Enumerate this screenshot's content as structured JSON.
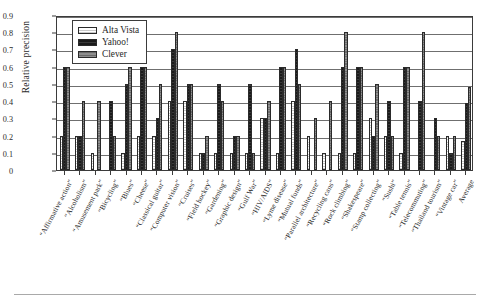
{
  "chart_data": {
    "type": "bar",
    "title": "",
    "xlabel": "",
    "ylabel": "Relative precision",
    "ylim": [
      0,
      0.9
    ],
    "ytick_labels": [
      "0",
      "0.1",
      "0.2",
      "0.3",
      "0.4",
      "0.5",
      "0.6",
      "0.7",
      "0.8",
      "0.9"
    ],
    "ytick_values": [
      0,
      0.1,
      0.2,
      0.3,
      0.4,
      0.5,
      0.6,
      0.7,
      0.8,
      0.9
    ],
    "grid": true,
    "legend_position": "upper-left-inside",
    "categories": [
      "“Affirmative action”",
      "“Alcoholism”",
      "“Amusement park”",
      "“Bicycling”",
      "“Blues”",
      "“Cheese”",
      "“Classical guitar”",
      "“Computer vision”",
      "“Cruises”",
      "“Field hockey”",
      "“Gardening”",
      "“Graphic design”",
      "“Gulf War”",
      "“HIV/AIDS”",
      "“Lyme disease”",
      "“Mutual funds”",
      "“Parallel architecture”",
      "“Recycling cans”",
      "“Rock climbing”",
      "“Shakespeare”",
      "“Stamp collecting”",
      "“Sushi”",
      "“Table tennis”",
      "“Telecommuting”",
      "“Thailand tourism”",
      "“Vintage car”",
      "Average"
    ],
    "series": [
      {
        "name": "Alta Vista",
        "color": "#c9c9c9",
        "values": [
          0.2,
          0.2,
          0.1,
          0.0,
          0.1,
          0.2,
          0.2,
          0.4,
          0.4,
          0.1,
          0.1,
          0.1,
          0.1,
          0.3,
          0.1,
          0.4,
          0.2,
          0.1,
          0.1,
          0.1,
          0.3,
          0.2,
          0.1,
          0.0,
          0.0,
          0.2,
          0.17
        ]
      },
      {
        "name": "Yahoo!",
        "color": "#1b1b1b",
        "values": [
          0.6,
          0.2,
          0.0,
          0.4,
          0.5,
          0.6,
          0.3,
          0.7,
          0.5,
          0.1,
          0.5,
          0.2,
          0.5,
          0.3,
          0.6,
          0.7,
          0.0,
          0.0,
          0.6,
          0.6,
          0.2,
          0.4,
          0.6,
          0.4,
          0.3,
          0.1,
          0.39
        ]
      },
      {
        "name": "Clever",
        "color": "#8e8e8e",
        "values": [
          0.6,
          0.4,
          0.4,
          0.2,
          0.6,
          0.6,
          0.5,
          0.8,
          0.5,
          0.2,
          0.4,
          0.2,
          0.1,
          0.4,
          0.6,
          0.5,
          0.3,
          0.4,
          0.8,
          0.6,
          0.5,
          0.2,
          0.6,
          0.8,
          0.2,
          0.2,
          0.48
        ]
      }
    ]
  },
  "legend": {
    "items": [
      {
        "label": "Alta Vista",
        "swatch": "alta-vista-swatch"
      },
      {
        "label": "Yahoo!",
        "swatch": "yahoo-swatch"
      },
      {
        "label": "Clever",
        "swatch": "clever-swatch"
      }
    ]
  }
}
